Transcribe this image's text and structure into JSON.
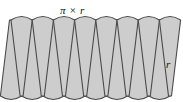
{
  "figure": {
    "name": "circle-sectors-rearranged-into-parallelogram",
    "labels": {
      "top": "π × r",
      "right": "r"
    },
    "geometry": {
      "sector_count_total": 16,
      "up_wedge_count": 8,
      "down_wedge_count": 8,
      "band_top_y": 20,
      "band_bottom_y": 96,
      "band_height": 76,
      "first_wedge_center_x": 11,
      "wedge_pitch_x": 21.2,
      "wedge_half_width_at_arc": 10.6,
      "arc_bulge": 7,
      "apex_inset": 1.5
    },
    "style": {
      "fill": "#cdcdcd",
      "stroke": "#4a4a4a",
      "stroke_width": 1.1,
      "background": "#ffffff",
      "label_color": "#111111"
    }
  }
}
